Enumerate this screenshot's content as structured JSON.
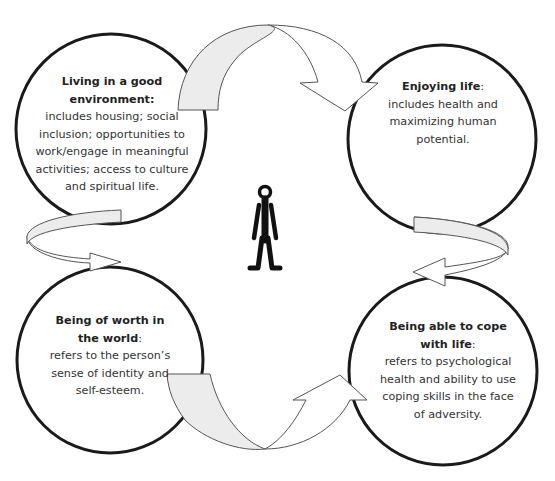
{
  "diagram": {
    "type": "cyclical-concept-diagram",
    "center_icon": "person-icon",
    "nodes": [
      {
        "id": "environment",
        "title": "Living in a good environment",
        "title_lines": [
          "Living in a good",
          "environment"
        ],
        "title_suffix": ":",
        "body_lines": [
          "includes housing; social",
          "inclusion; opportunities to",
          "work/engage in meaningful",
          "activities; access to culture",
          "and spiritual life."
        ],
        "position": "top-left"
      },
      {
        "id": "enjoying",
        "title": "Enjoying life",
        "title_lines": [
          "Enjoying life"
        ],
        "title_suffix": ":",
        "body_lines": [
          "includes health and",
          "maximizing human",
          "potential."
        ],
        "position": "top-right"
      },
      {
        "id": "worth",
        "title": "Being of worth in the world",
        "title_lines": [
          "Being of worth in",
          "the world"
        ],
        "title_suffix": ":",
        "body_lines": [
          "refers to the person’s",
          "sense of identity and",
          "self-esteem."
        ],
        "position": "bottom-left"
      },
      {
        "id": "cope",
        "title": "Being able to cope with life",
        "title_lines": [
          "Being able to cope",
          "with life"
        ],
        "title_suffix": ":",
        "body_lines": [
          "refers to psychological",
          "health and ability to use",
          "coping skills in the face",
          "of adversity."
        ],
        "position": "bottom-right"
      }
    ],
    "arrows": [
      {
        "from": "environment",
        "to": "enjoying",
        "position": "top"
      },
      {
        "from": "enjoying",
        "to": "cope",
        "position": "right"
      },
      {
        "from": "worth",
        "to": "cope",
        "position": "bottom"
      },
      {
        "from": "environment",
        "to": "worth",
        "position": "left"
      }
    ],
    "colors": {
      "circle_stroke": "#1a1a1a",
      "arrow_fill_front": "#ececec",
      "arrow_fill_back": "#ffffff",
      "arrow_stroke": "#555555",
      "figure": "#111111",
      "text": "#333333"
    }
  }
}
